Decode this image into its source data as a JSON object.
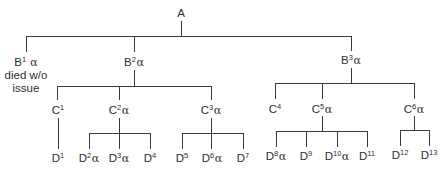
{
  "diagram": {
    "type": "family-tree",
    "line_color": "#3a3a3a",
    "text_color": "#2e2e2e",
    "root": {
      "id": "A",
      "base": "A",
      "sup": "",
      "alpha": false,
      "x": 181,
      "y": 7
    },
    "nodes": [
      {
        "id": "B1",
        "base": "B",
        "sup": "1",
        "alpha": true,
        "spaced": true,
        "x": 26,
        "y": 56,
        "note_lines": [
          "died w/o",
          "issue"
        ]
      },
      {
        "id": "B2",
        "base": "B",
        "sup": "2",
        "alpha": true,
        "x": 134,
        "y": 56
      },
      {
        "id": "B3",
        "base": "B",
        "sup": "3",
        "alpha": true,
        "x": 351,
        "y": 54
      },
      {
        "id": "C1",
        "base": "C",
        "sup": "1",
        "alpha": false,
        "x": 58,
        "y": 104
      },
      {
        "id": "C2",
        "base": "C",
        "sup": "2",
        "alpha": true,
        "x": 119,
        "y": 104
      },
      {
        "id": "C3",
        "base": "C",
        "sup": "3",
        "alpha": true,
        "x": 211,
        "y": 104
      },
      {
        "id": "C4",
        "base": "C",
        "sup": "4",
        "alpha": false,
        "x": 275,
        "y": 103
      },
      {
        "id": "C5",
        "base": "C",
        "sup": "5",
        "alpha": true,
        "x": 322,
        "y": 103
      },
      {
        "id": "C6",
        "base": "C",
        "sup": "6",
        "alpha": true,
        "x": 414,
        "y": 103
      },
      {
        "id": "D1",
        "base": "D",
        "sup": "1",
        "alpha": false,
        "x": 58,
        "y": 152
      },
      {
        "id": "D2",
        "base": "D",
        "sup": "2",
        "alpha": true,
        "x": 89,
        "y": 152
      },
      {
        "id": "D3",
        "base": "D",
        "sup": "3",
        "alpha": true,
        "x": 119,
        "y": 152
      },
      {
        "id": "D4",
        "base": "D",
        "sup": "4",
        "alpha": false,
        "x": 150,
        "y": 152
      },
      {
        "id": "D5",
        "base": "D",
        "sup": "5",
        "alpha": false,
        "x": 182,
        "y": 152
      },
      {
        "id": "D6",
        "base": "D",
        "sup": "6",
        "alpha": true,
        "x": 212,
        "y": 152
      },
      {
        "id": "D7",
        "base": "D",
        "sup": "7",
        "alpha": false,
        "x": 243,
        "y": 152
      },
      {
        "id": "D8",
        "base": "D",
        "sup": "8",
        "alpha": true,
        "x": 276,
        "y": 150
      },
      {
        "id": "D9",
        "base": "D",
        "sup": "9",
        "alpha": false,
        "x": 306,
        "y": 150
      },
      {
        "id": "D10",
        "base": "D",
        "sup": "10",
        "alpha": true,
        "x": 337,
        "y": 150
      },
      {
        "id": "D11",
        "base": "D",
        "sup": "11",
        "alpha": false,
        "x": 367,
        "y": 150
      },
      {
        "id": "D12",
        "base": "D",
        "sup": "12",
        "alpha": false,
        "x": 400,
        "y": 149
      },
      {
        "id": "D13",
        "base": "D",
        "sup": "13",
        "alpha": false,
        "x": 429,
        "y": 149
      }
    ],
    "edges": {
      "horizontal": [
        {
          "x1": 26,
          "x2": 351,
          "y": 36
        },
        {
          "x1": 57,
          "x2": 211,
          "y": 86
        },
        {
          "x1": 275,
          "x2": 414,
          "y": 83
        },
        {
          "x1": 89,
          "x2": 150,
          "y": 133
        },
        {
          "x1": 182,
          "x2": 243,
          "y": 133
        },
        {
          "x1": 276,
          "x2": 367,
          "y": 131
        },
        {
          "x1": 400,
          "x2": 429,
          "y": 130
        }
      ],
      "vertical": [
        {
          "x": 181,
          "y1": 21,
          "y2": 36
        },
        {
          "x": 26,
          "y1": 36,
          "y2": 52
        },
        {
          "x": 134,
          "y1": 36,
          "y2": 52
        },
        {
          "x": 351,
          "y1": 36,
          "y2": 51
        },
        {
          "x": 134,
          "y1": 70,
          "y2": 86
        },
        {
          "x": 351,
          "y1": 68,
          "y2": 83
        },
        {
          "x": 57,
          "y1": 86,
          "y2": 100
        },
        {
          "x": 119,
          "y1": 86,
          "y2": 100
        },
        {
          "x": 211,
          "y1": 86,
          "y2": 100
        },
        {
          "x": 275,
          "y1": 83,
          "y2": 99
        },
        {
          "x": 322,
          "y1": 83,
          "y2": 99
        },
        {
          "x": 414,
          "y1": 83,
          "y2": 99
        },
        {
          "x": 58,
          "y1": 118,
          "y2": 149
        },
        {
          "x": 119,
          "y1": 118,
          "y2": 149
        },
        {
          "x": 89,
          "y1": 133,
          "y2": 149
        },
        {
          "x": 150,
          "y1": 133,
          "y2": 149
        },
        {
          "x": 211,
          "y1": 118,
          "y2": 149
        },
        {
          "x": 182,
          "y1": 133,
          "y2": 149
        },
        {
          "x": 243,
          "y1": 133,
          "y2": 149
        },
        {
          "x": 322,
          "y1": 116,
          "y2": 131
        },
        {
          "x": 276,
          "y1": 131,
          "y2": 147
        },
        {
          "x": 306,
          "y1": 131,
          "y2": 147
        },
        {
          "x": 337,
          "y1": 131,
          "y2": 147
        },
        {
          "x": 367,
          "y1": 131,
          "y2": 147
        },
        {
          "x": 414,
          "y1": 116,
          "y2": 130
        },
        {
          "x": 400,
          "y1": 130,
          "y2": 146
        },
        {
          "x": 429,
          "y1": 130,
          "y2": 146
        }
      ]
    },
    "alpha_glyph": "α"
  }
}
